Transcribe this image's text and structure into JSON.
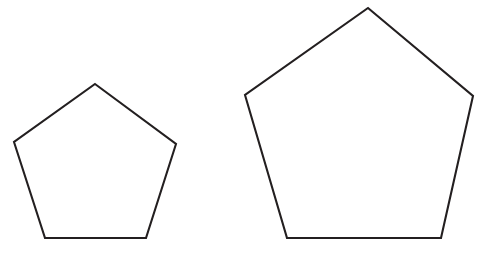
{
  "figure": {
    "title": "Two similar regular pentagons",
    "background_color": "#ffffff",
    "canvas": {
      "width": 482,
      "height": 267
    },
    "stroke_color": "#231f20",
    "fill_color": "#ffffff",
    "stroke_width": 2.1,
    "shape_count": 2,
    "shapes": [
      {
        "name": "small-pentagon",
        "label": "Small pentagon",
        "sides": 5,
        "regular": true,
        "filled": false,
        "center": {
          "x": 95,
          "y": 157
        },
        "circumradius": 73,
        "side_length": 86,
        "rotation_degrees": 0,
        "points": "95,84 176,144 146,238 45,238 14,142",
        "vertices": [
          {
            "name": "apex",
            "x": 95,
            "y": 84
          },
          {
            "name": "right",
            "x": 176,
            "y": 144
          },
          {
            "name": "bottom-right",
            "x": 146,
            "y": 238
          },
          {
            "name": "bottom-left",
            "x": 45,
            "y": 238
          },
          {
            "name": "left",
            "x": 14,
            "y": 142
          }
        ]
      },
      {
        "name": "large-pentagon",
        "label": "Large pentagon",
        "sides": 5,
        "regular": true,
        "filled": false,
        "center": {
          "x": 359,
          "y": 145
        },
        "circumradius": 137,
        "side_length": 161,
        "rotation_degrees": 0,
        "points": "368,8 473,96 441,238 287,238 245,95",
        "vertices": [
          {
            "name": "apex",
            "x": 368,
            "y": 8
          },
          {
            "name": "right",
            "x": 473,
            "y": 96
          },
          {
            "name": "bottom-right",
            "x": 441,
            "y": 238
          },
          {
            "name": "bottom-left",
            "x": 287,
            "y": 238
          },
          {
            "name": "left",
            "x": 245,
            "y": 95
          }
        ]
      }
    ],
    "scale_factor": "1.87",
    "annotations": []
  }
}
